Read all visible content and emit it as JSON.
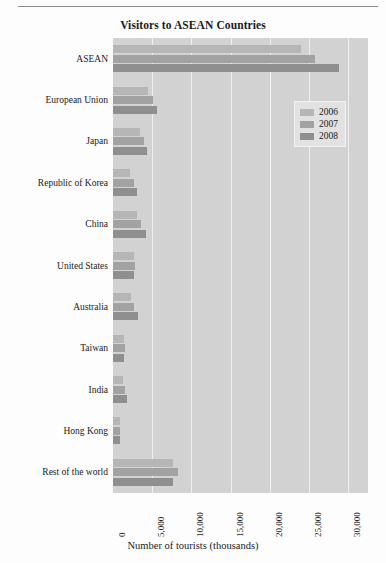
{
  "chart_data": {
    "type": "bar",
    "orientation": "horizontal",
    "title": "Visitors to ASEAN Countries",
    "xlabel": "Number of tourists (thousands)",
    "ylabel": "",
    "xlim": [
      0,
      32500
    ],
    "xticks": [
      0,
      5000,
      10000,
      15000,
      20000,
      25000,
      30000
    ],
    "xtick_labels": [
      "0",
      "5,000",
      "10,000",
      "15,000",
      "20,000",
      "25,000",
      "30,000"
    ],
    "grid": true,
    "grid_axis": "x",
    "legend_position": "upper right",
    "categories": [
      "ASEAN",
      "European Union",
      "Japan",
      "Republic of Korea",
      "China",
      "United States",
      "Australia",
      "Taiwan",
      "India",
      "Hong Kong",
      "Rest of the world"
    ],
    "series": [
      {
        "name": "2006",
        "color": "#b6b6b6",
        "values": [
          24000,
          4400,
          3500,
          2200,
          3000,
          2700,
          2300,
          1350,
          1300,
          850,
          7700
        ]
      },
      {
        "name": "2007",
        "color": "#a2a2a2",
        "values": [
          25700,
          5100,
          3900,
          2700,
          3550,
          2750,
          2650,
          1500,
          1550,
          900,
          8300
        ]
      },
      {
        "name": "2008",
        "color": "#8f8f8f",
        "values": [
          28800,
          5600,
          4300,
          3000,
          4250,
          2700,
          3150,
          1450,
          1800,
          950,
          7700
        ]
      }
    ]
  },
  "legend": {
    "entries": [
      "2006",
      "2007",
      "2008"
    ]
  }
}
